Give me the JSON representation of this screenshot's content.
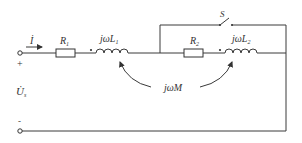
{
  "diagram": {
    "type": "circuit",
    "current_label": "İ",
    "voltage_label": "U̇",
    "voltage_subscript": "s",
    "plus_sign": "+",
    "minus_sign": "-",
    "r1_label": "R",
    "r1_sub": "1",
    "r2_label": "R",
    "r2_sub": "2",
    "l1_label_prefix": "jω",
    "l1_label_var": "L",
    "l1_sub": "1",
    "l2_label_prefix": "jω",
    "l2_label_var": "L",
    "l2_sub": "2",
    "mutual_label_prefix": "jω",
    "mutual_label_var": "M",
    "switch_label": "S",
    "dot_mark": "•"
  }
}
